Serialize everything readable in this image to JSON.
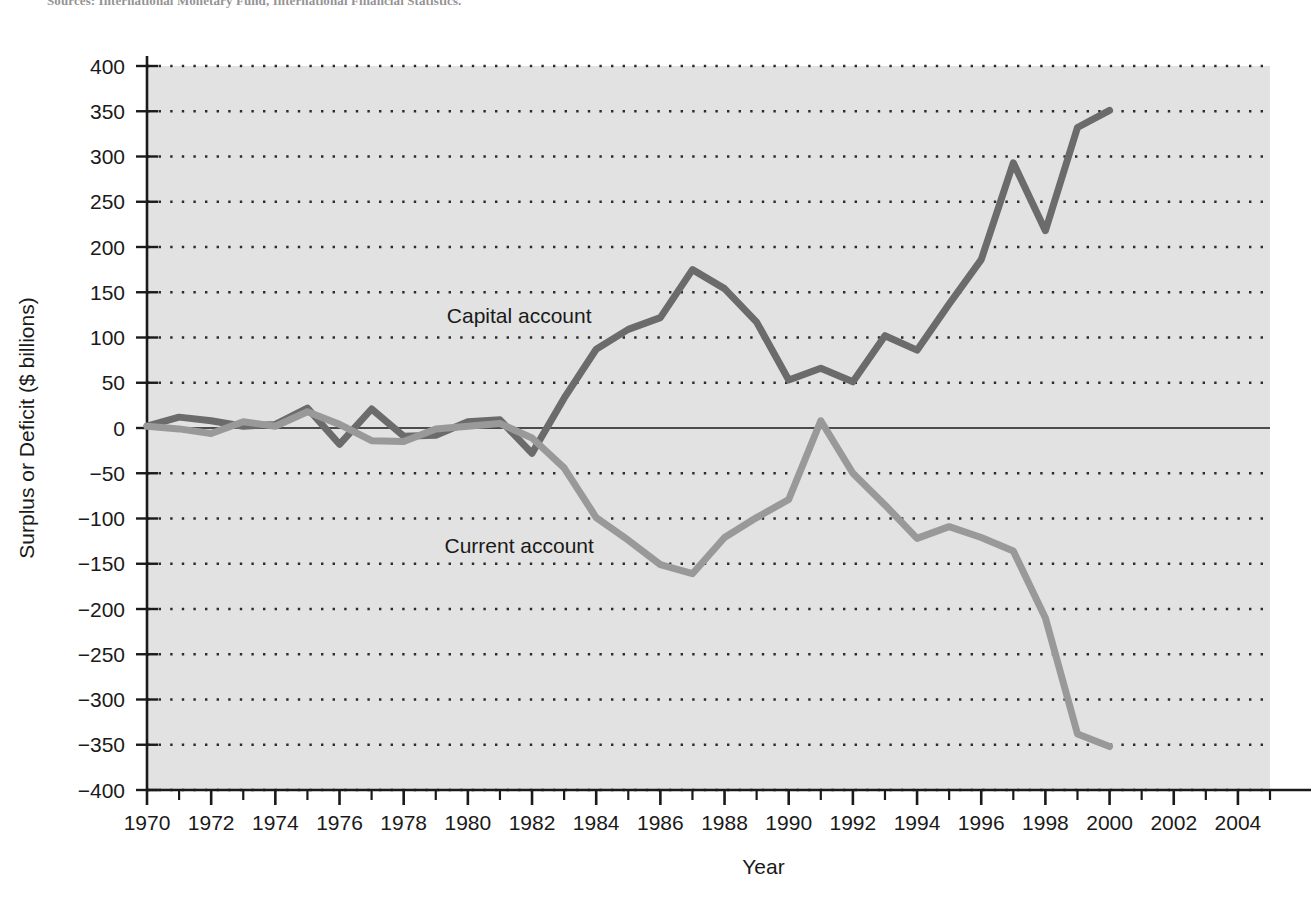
{
  "figure": {
    "source_note": "Sources: International Monetary Fund, International Financial Statistics."
  },
  "chart_data": {
    "type": "line",
    "title": "",
    "xlabel": "Year",
    "ylabel": "Surplus or Deficit ($ billions)",
    "xlim": [
      1970,
      2005
    ],
    "ylim": [
      -400,
      400
    ],
    "ytick_step": 50,
    "xtick_step": 2,
    "xtick_minor_step": 1,
    "grid": "horizontal-dotted",
    "legend_position": "inline-annotations",
    "y_ticks": [
      "400",
      "350",
      "300",
      "250",
      "200",
      "150",
      "100",
      "50",
      "0",
      "−50",
      "−100",
      "−150",
      "−200",
      "−250",
      "−300",
      "−350",
      "−400"
    ],
    "x_ticks": [
      "1970",
      "1972",
      "1974",
      "1976",
      "1978",
      "1980",
      "1982",
      "1984",
      "1986",
      "1988",
      "1990",
      "1992",
      "1994",
      "1996",
      "1998",
      "2000",
      "2002",
      "2004"
    ],
    "x": [
      1970,
      1971,
      1972,
      1973,
      1974,
      1975,
      1976,
      1977,
      1978,
      1979,
      1980,
      1981,
      1982,
      1983,
      1984,
      1985,
      1986,
      1987,
      1988,
      1989,
      1990,
      1991,
      1992,
      1993,
      1994,
      1995,
      1996,
      1997,
      1998,
      1999,
      2000
    ],
    "series": [
      {
        "name": "Capital account",
        "label": "Capital account",
        "color": "#6b6b6b",
        "line_width": 7,
        "label_x": 1981.6,
        "label_y": 124,
        "values": [
          2,
          12,
          8,
          2,
          4,
          22,
          -18,
          21,
          -9,
          -8,
          7,
          9,
          -28,
          33,
          87,
          109,
          122,
          175,
          154,
          117,
          53,
          66,
          51,
          102,
          86,
          137,
          186,
          293,
          218,
          332,
          351
        ]
      },
      {
        "name": "Current account",
        "label": "Current account",
        "color": "#999999",
        "line_width": 7,
        "label_x": 1981.6,
        "label_y": -130,
        "values": [
          2,
          -1,
          -6,
          7,
          2,
          18,
          4,
          -14,
          -15,
          -1,
          2,
          5,
          -11,
          -44,
          -99,
          -124,
          -151,
          -161,
          -121,
          -99,
          -79,
          8,
          -50,
          -85,
          -122,
          -109,
          -121,
          -136,
          -210,
          -338,
          -352
        ]
      }
    ],
    "annotations": [
      {
        "text": "Capital account",
        "x": 1981.6,
        "y": 124
      },
      {
        "text": "Current account",
        "x": 1981.6,
        "y": -130
      }
    ]
  }
}
